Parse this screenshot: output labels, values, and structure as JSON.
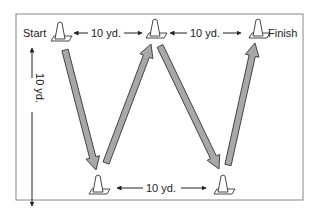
{
  "diagram": {
    "labels": {
      "start": "Start",
      "finish": "Finish",
      "top_left_dist": "10 yd.",
      "top_right_dist": "10 yd.",
      "bottom_dist": "10 yd.",
      "vertical_dist": "10 yd."
    },
    "colors": {
      "arrow_fill": "#a8a8a8",
      "arrow_stroke": "#333333",
      "frame": "#888888",
      "text": "#222222"
    },
    "cones": [
      "start-cone",
      "top-middle-cone",
      "finish-cone",
      "bottom-left-cone",
      "bottom-right-cone"
    ],
    "path_sequence": [
      "Start",
      "bottom-left",
      "top-middle",
      "bottom-right",
      "Finish"
    ]
  }
}
